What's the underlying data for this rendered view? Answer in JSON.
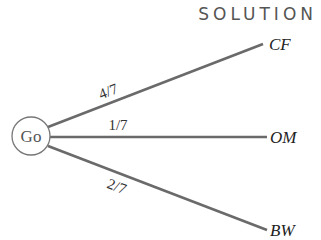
{
  "title": "SOLUTION",
  "diagram": {
    "type": "probability-tree",
    "root": {
      "label": "Go"
    },
    "branches": [
      {
        "to": "CF",
        "probability": "4/7"
      },
      {
        "to": "OM",
        "probability": "1/7"
      },
      {
        "to": "BW",
        "probability": "2/7"
      }
    ]
  },
  "colors": {
    "line": "#666666",
    "circle": "#777777",
    "text": "#333333"
  }
}
